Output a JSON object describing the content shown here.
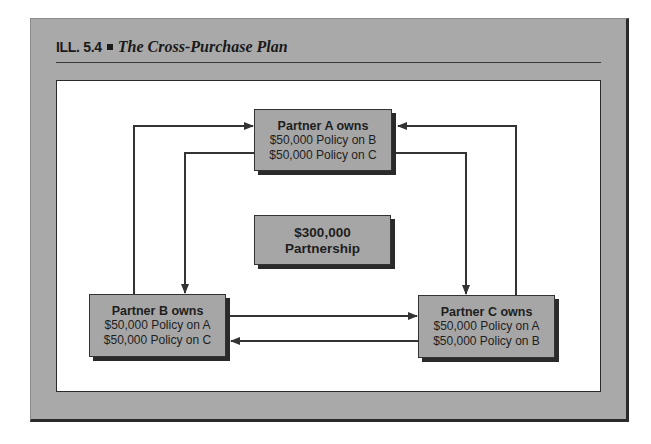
{
  "figure": {
    "label": "ILL. 5.4",
    "title": "The Cross-Purchase Plan"
  },
  "nodes": {
    "partner_a": {
      "heading": "Partner A owns",
      "policies": [
        "$50,000 Policy on B",
        "$50,000 Policy on C"
      ]
    },
    "partnership": {
      "amount": "$300,000",
      "label": "Partnership"
    },
    "partner_b": {
      "heading": "Partner B owns",
      "policies": [
        "$50,000 Policy on A",
        "$50,000 Policy on C"
      ]
    },
    "partner_c": {
      "heading": "Partner C owns",
      "policies": [
        "$50,000 Policy on A",
        "$50,000 Policy on B"
      ]
    }
  },
  "edges": [
    {
      "from": "partner_b",
      "to": "partner_a",
      "route": "left-outer"
    },
    {
      "from": "partner_a",
      "to": "partner_b",
      "route": "left-inner"
    },
    {
      "from": "partner_c",
      "to": "partner_a",
      "route": "right-outer"
    },
    {
      "from": "partner_a",
      "to": "partner_c",
      "route": "right-inner"
    },
    {
      "from": "partner_b",
      "to": "partner_c",
      "route": "upper-horizontal"
    },
    {
      "from": "partner_c",
      "to": "partner_b",
      "route": "lower-horizontal"
    }
  ],
  "colors": {
    "frame": "#a9a9a9",
    "box": "#a6a6a6",
    "shadow": "#2a2a2a",
    "line": "#333333"
  }
}
